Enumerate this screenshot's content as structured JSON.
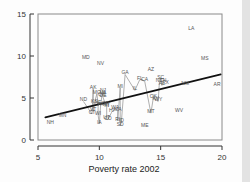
{
  "chart_data": {
    "type": "scatter",
    "title": "",
    "xlabel": "Poverty rate 2002",
    "ylabel": "",
    "xlim": [
      5,
      20
    ],
    "ylim": [
      0,
      15
    ],
    "xticks": [
      5,
      10,
      15,
      20
    ],
    "yticks": [
      0,
      5,
      10,
      15
    ],
    "grid": false,
    "legend": null,
    "marker_style": "state-abbreviation-text",
    "colors": {
      "frame": "#8a8a8a",
      "regression_line": "#111111",
      "connector_line": "#9a9a9a",
      "label": "#555555",
      "tick": "#333333"
    },
    "points": [
      {
        "label": "LA",
        "x": 17.5,
        "y": 13.1
      },
      {
        "label": "MS",
        "x": 18.6,
        "y": 9.5
      },
      {
        "label": "MD",
        "x": 8.9,
        "y": 9.6
      },
      {
        "label": "NV",
        "x": 10.1,
        "y": 8.9
      },
      {
        "label": "AZ",
        "x": 14.2,
        "y": 8.2
      },
      {
        "label": "GA",
        "x": 12.1,
        "y": 7.8
      },
      {
        "label": "SC",
        "x": 15.0,
        "y": 7.3
      },
      {
        "label": "FL",
        "x": 13.3,
        "y": 7.2
      },
      {
        "label": "CA",
        "x": 13.7,
        "y": 7.0
      },
      {
        "label": "NC",
        "x": 14.9,
        "y": 6.9
      },
      {
        "label": "TN",
        "x": 15.2,
        "y": 6.9
      },
      {
        "label": "TX",
        "x": 15.4,
        "y": 6.7
      },
      {
        "label": "NM",
        "x": 17.0,
        "y": 6.5
      },
      {
        "label": "AR",
        "x": 19.6,
        "y": 6.4
      },
      {
        "label": "AL",
        "x": 15.1,
        "y": 6.5
      },
      {
        "label": "MI",
        "x": 11.7,
        "y": 6.2
      },
      {
        "label": "AK",
        "x": 9.5,
        "y": 6.1
      },
      {
        "label": "IL",
        "x": 12.9,
        "y": 5.9
      },
      {
        "label": "NJ",
        "x": 10.3,
        "y": 5.7
      },
      {
        "label": "MO",
        "x": 9.8,
        "y": 5.5
      },
      {
        "label": "VA",
        "x": 10.3,
        "y": 5.5
      },
      {
        "label": "DE",
        "x": 10.3,
        "y": 5.1
      },
      {
        "label": "OH",
        "x": 10.2,
        "y": 5.2
      },
      {
        "label": "OK",
        "x": 14.4,
        "y": 5.0
      },
      {
        "label": "KY",
        "x": 14.6,
        "y": 4.8
      },
      {
        "label": "ND",
        "x": 8.7,
        "y": 4.6
      },
      {
        "label": "KS",
        "x": 9.6,
        "y": 4.4
      },
      {
        "label": "NE",
        "x": 9.9,
        "y": 4.3
      },
      {
        "label": "OR",
        "x": 10.5,
        "y": 4.2
      },
      {
        "label": "PA",
        "x": 10.1,
        "y": 4.1
      },
      {
        "label": "NY",
        "x": 10.6,
        "y": 4.0
      },
      {
        "label": "IN",
        "x": 10.6,
        "y": 3.9
      },
      {
        "label": "WA",
        "x": 11.3,
        "y": 3.7
      },
      {
        "label": "MA",
        "x": 11.5,
        "y": 3.5
      },
      {
        "label": "CT",
        "x": 9.4,
        "y": 3.1
      },
      {
        "label": "WI",
        "x": 9.9,
        "y": 3.0
      },
      {
        "label": "MT",
        "x": 14.2,
        "y": 3.2
      },
      {
        "label": "WV",
        "x": 16.5,
        "y": 3.3
      },
      {
        "label": "WY",
        "x": 14.8,
        "y": 4.6
      },
      {
        "label": "MN",
        "x": 7.0,
        "y": 2.7
      },
      {
        "label": "NH",
        "x": 6.0,
        "y": 1.9
      },
      {
        "label": "IA",
        "x": 10.0,
        "y": 1.9
      },
      {
        "label": "UT",
        "x": 10.6,
        "y": 2.5
      },
      {
        "label": "CO",
        "x": 10.7,
        "y": 2.4
      },
      {
        "label": "RI",
        "x": 11.5,
        "y": 2.3
      },
      {
        "label": "ID",
        "x": 11.8,
        "y": 2.2
      },
      {
        "label": "SD",
        "x": 11.7,
        "y": 1.7
      },
      {
        "label": "ME",
        "x": 13.7,
        "y": 1.5
      },
      {
        "label": "VT",
        "x": 9.5,
        "y": 3.4
      },
      {
        "label": "HI",
        "x": 11.0,
        "y": 3.3
      }
    ],
    "regression_line": {
      "style": "solid-thick-black",
      "x0": 5.6,
      "y0": 2.7,
      "x1": 19.9,
      "y1": 7.8
    },
    "connector_line": {
      "style": "solid-thin-gray",
      "description": "gray polyline threading the point cloud"
    }
  }
}
